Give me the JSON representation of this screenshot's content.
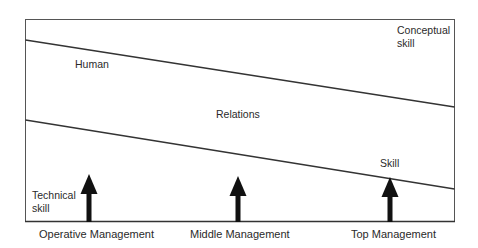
{
  "diagram": {
    "type": "management-skills-mix",
    "regions": {
      "conceptual": {
        "line1": "Conceptual",
        "line2": "skill"
      },
      "human_relations": {
        "word1": "Human",
        "word2": "Relations",
        "word3": "Skill"
      },
      "technical": {
        "line1": "Technical",
        "line2": "skill"
      }
    },
    "levels": [
      {
        "label": "Operative Management"
      },
      {
        "label": "Middle Management"
      },
      {
        "label": "Top Management"
      }
    ],
    "colors": {
      "frame": "#555555",
      "divider": "#333333",
      "arrow": "#111111",
      "text": "#2a2a2a",
      "background": "#ffffff"
    }
  }
}
